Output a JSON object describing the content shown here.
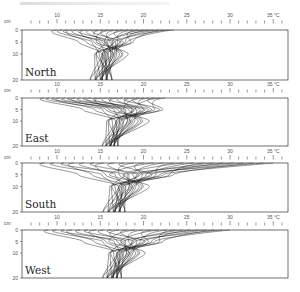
{
  "figure": {
    "type": "soil temperature depth profiles by aspect",
    "x_unit": "°C",
    "y_unit": "cm",
    "x_ticks_major": [
      10,
      15,
      20,
      25,
      30,
      35
    ],
    "x_tick_minor_step": 1,
    "x_range": [
      6.0,
      36.8
    ],
    "y_ticks": [
      0,
      5,
      10,
      20
    ],
    "y_range": [
      0,
      20
    ]
  },
  "chart_data": [
    {
      "type": "line",
      "title": "North",
      "xlabel": "°C",
      "ylabel": "cm",
      "xlim": [
        6,
        36.8
      ],
      "ylim": [
        20,
        0
      ],
      "surface_range_c": [
        10.0,
        23.5
      ],
      "depth5_range_c": [
        12.5,
        20.0
      ],
      "depth10_range_c": [
        13.0,
        18.5
      ],
      "depth20_range_c": [
        13.5,
        17.0
      ],
      "curve_count": 24
    },
    {
      "type": "line",
      "title": "East",
      "xlabel": "°C",
      "ylabel": "cm",
      "xlim": [
        6,
        36.8
      ],
      "ylim": [
        20,
        0
      ],
      "surface_range_c": [
        8.5,
        22.5
      ],
      "depth5_range_c": [
        13.0,
        24.0
      ],
      "depth10_range_c": [
        14.0,
        21.0
      ],
      "depth20_range_c": [
        15.0,
        17.5
      ],
      "curve_count": 24
    },
    {
      "type": "line",
      "title": "South",
      "xlabel": "°C",
      "ylabel": "cm",
      "xlim": [
        6,
        36.8
      ],
      "ylim": [
        20,
        0
      ],
      "surface_range_c": [
        8.5,
        35.0
      ],
      "depth5_range_c": [
        12.5,
        25.5
      ],
      "depth10_range_c": [
        14.5,
        21.0
      ],
      "depth20_range_c": [
        15.0,
        18.5
      ],
      "curve_count": 24
    },
    {
      "type": "line",
      "title": "West",
      "xlabel": "°C",
      "ylabel": "cm",
      "xlim": [
        6,
        36.8
      ],
      "ylim": [
        20,
        0
      ],
      "surface_range_c": [
        9.0,
        30.0
      ],
      "depth5_range_c": [
        13.0,
        24.0
      ],
      "depth10_range_c": [
        14.5,
        20.5
      ],
      "depth20_range_c": [
        15.0,
        18.0
      ],
      "curve_count": 24
    }
  ],
  "panels": [
    {
      "label": "North",
      "top_tick_y": 22,
      "axis_top": 30,
      "axis_bottom": 80
    },
    {
      "label": "East",
      "top_tick_y": 91,
      "axis_top": 98,
      "axis_bottom": 146
    },
    {
      "label": "South",
      "top_tick_y": 158,
      "axis_top": 163,
      "axis_bottom": 212
    },
    {
      "label": "West",
      "top_tick_y": 224,
      "axis_top": 230,
      "axis_bottom": 278
    }
  ],
  "layout": {
    "axis_left_px": 22,
    "axis_right_px": 288,
    "px_per_degree": 8.65,
    "x_origin_deg_px": 57,
    "x_origin_deg": 10
  },
  "colors": {
    "line": "#1a1a1a",
    "axis": "#333333",
    "tick_label": "#555555"
  }
}
